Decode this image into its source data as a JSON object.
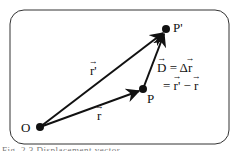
{
  "diagram": {
    "points": {
      "origin": {
        "label": "O",
        "x": 40,
        "y": 127
      },
      "p": {
        "label": "P",
        "x": 143,
        "y": 89
      },
      "p_prime": {
        "label": "P'",
        "x": 166,
        "y": 29
      }
    },
    "vectors": {
      "r": {
        "symbol": "r",
        "from": "O",
        "to": "P"
      },
      "r_prime": {
        "symbol": "r'",
        "from": "O",
        "to": "P'"
      },
      "d": {
        "symbol": "D",
        "from": "P",
        "to": "P'"
      }
    },
    "equation": {
      "line1_lhs": "D",
      "line1_eq": " = Δ",
      "line1_rhs": "r",
      "line2_eq": "= ",
      "line2_a": "r'",
      "line2_minus": " − ",
      "line2_b": "r"
    },
    "caption": "Fig. 2.3  Displacement vector"
  },
  "colors": {
    "stroke": "#111111",
    "frame": "#333333",
    "background": "#ffffff"
  }
}
